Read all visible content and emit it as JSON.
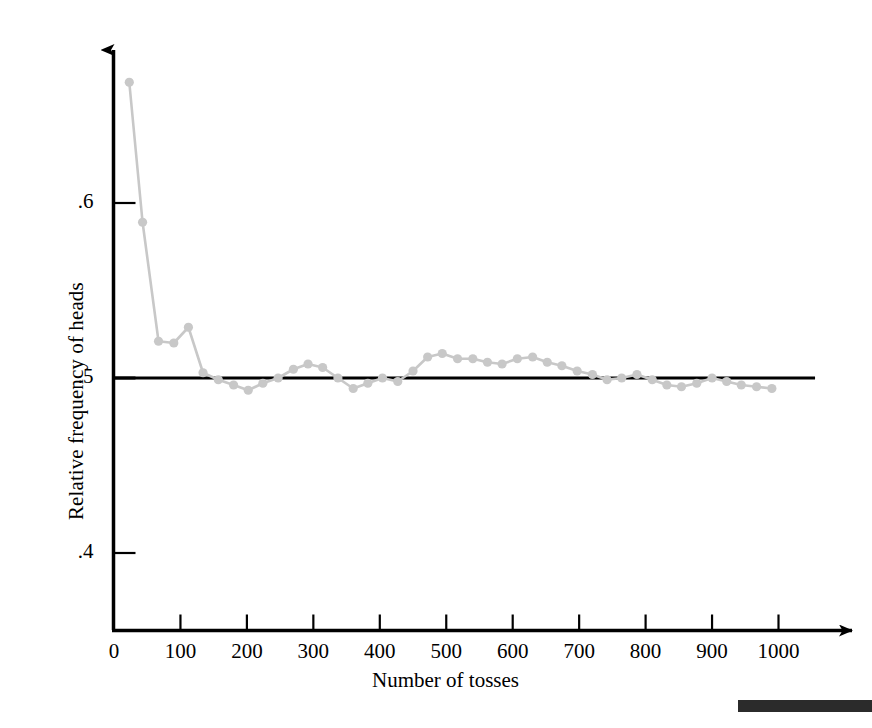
{
  "figure": {
    "background_color": "#ffffff",
    "axis_color": "#000000",
    "series_color": "#c8c8c8",
    "reference_line_color": "#000000",
    "edge_bar_color": "#2b2b2b"
  },
  "axes": {
    "y_label": "Relative frequency of heads",
    "x_label": "Number of tosses",
    "y_ticks": [
      {
        "value": 0.6,
        "label": ".6"
      },
      {
        "value": 0.5,
        "label": ".5"
      },
      {
        "value": 0.4,
        "label": ".4"
      }
    ],
    "x_ticks": [
      {
        "value": 0,
        "label": "0"
      },
      {
        "value": 100,
        "label": "100"
      },
      {
        "value": 200,
        "label": "200"
      },
      {
        "value": 300,
        "label": "300"
      },
      {
        "value": 400,
        "label": "400"
      },
      {
        "value": 500,
        "label": "500"
      },
      {
        "value": 600,
        "label": "600"
      },
      {
        "value": 700,
        "label": "700"
      },
      {
        "value": 800,
        "label": "800"
      },
      {
        "value": 900,
        "label": "900"
      },
      {
        "value": 1000,
        "label": "1000"
      }
    ]
  },
  "chart_data": {
    "type": "line",
    "title": "",
    "subtitle": "",
    "xlabel": "Number of tosses",
    "ylabel": "Relative frequency of heads",
    "xlim": [
      0,
      1060
    ],
    "ylim": [
      0.34,
      0.71
    ],
    "grid": false,
    "legend": null,
    "markers": true,
    "marker_color": "#c8c8c8",
    "line_color": "#c8c8c8",
    "reference_line": {
      "y": 0.5,
      "x_start": 0,
      "x_end": 1055,
      "color": "#000000",
      "width": 3
    },
    "x": [
      23,
      43,
      67,
      90,
      112,
      134,
      157,
      180,
      202,
      224,
      247,
      270,
      292,
      314,
      337,
      360,
      382,
      404,
      427,
      450,
      472,
      494,
      517,
      540,
      562,
      584,
      607,
      630,
      652,
      674,
      697,
      720,
      742,
      764,
      787,
      810,
      832,
      854,
      877,
      900,
      922,
      944,
      967,
      990
    ],
    "values": [
      0.669,
      0.589,
      0.521,
      0.52,
      0.529,
      0.503,
      0.499,
      0.496,
      0.493,
      0.497,
      0.5,
      0.505,
      0.508,
      0.506,
      0.5,
      0.494,
      0.497,
      0.5,
      0.498,
      0.504,
      0.512,
      0.514,
      0.511,
      0.511,
      0.509,
      0.508,
      0.511,
      0.512,
      0.509,
      0.507,
      0.504,
      0.502,
      0.499,
      0.5,
      0.502,
      0.499,
      0.496,
      0.495,
      0.497,
      0.5,
      0.498,
      0.496,
      0.495,
      0.494
    ]
  },
  "decorations": {
    "bottom_right_bar": "page-edge-bar"
  }
}
